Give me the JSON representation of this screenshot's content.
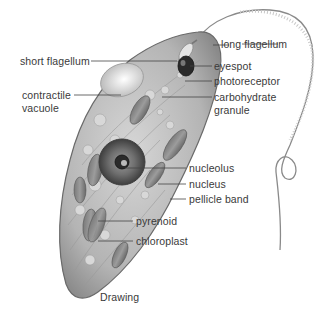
{
  "figure": {
    "caption": "Drawing",
    "colors": {
      "background": "#ffffff",
      "label_text": "#3a3a3a",
      "leader_line": "#444444",
      "body_fill": "#bdbdbd",
      "body_outline": "#6a6a6a",
      "nucleus": "#555555",
      "eyespot": "#222222"
    }
  },
  "labels": {
    "long_flagellum": "long flagellum",
    "short_flagellum": "short flagellum",
    "eyespot": "eyespot",
    "photoreceptor": "photoreceptor",
    "carbohydrate_granule_1": "carbohydrate",
    "carbohydrate_granule_2": "granule",
    "contractile_vacuole_1": "contractile",
    "contractile_vacuole_2": "vacuole",
    "nucleolus": "nucleolus",
    "nucleus": "nucleus",
    "pellicle_band": "pellicle band",
    "pyrenoid": "pyrenoid",
    "chloroplast": "chloroplast"
  }
}
